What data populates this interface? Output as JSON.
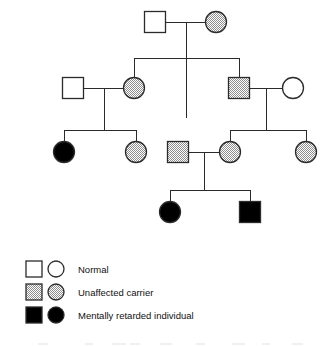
{
  "diagram": {
    "type": "pedigree-chart",
    "title": "",
    "width": 331,
    "height": 346,
    "colors": {
      "line": "#2b2b2b",
      "normal_fill": "#ffffff",
      "carrier_fill": "#9a9a9a",
      "affected_fill": "#000000",
      "background": "#ffffff"
    }
  },
  "legend": {
    "rows": [
      {
        "square_status": "normal",
        "circle_status": "normal",
        "label": "Normal"
      },
      {
        "square_status": "carrier",
        "circle_status": "carrier",
        "label": "Unaffected carrier"
      },
      {
        "square_status": "affected",
        "circle_status": "affected",
        "label": "Mentally retarded individual"
      }
    ]
  },
  "individuals": [
    {
      "id": "I-1",
      "generation": 1,
      "sex": "male",
      "status": "normal",
      "cx": 155,
      "cy": 22,
      "size": 21
    },
    {
      "id": "I-2",
      "generation": 1,
      "sex": "female",
      "status": "carrier",
      "cx": 216,
      "cy": 22,
      "size": 21
    },
    {
      "id": "II-1",
      "generation": 2,
      "sex": "male",
      "status": "normal",
      "cx": 73,
      "cy": 88,
      "size": 21
    },
    {
      "id": "II-2",
      "generation": 2,
      "sex": "female",
      "status": "carrier",
      "cx": 134,
      "cy": 88,
      "size": 21
    },
    {
      "id": "II-3",
      "generation": 2,
      "sex": "male",
      "status": "carrier",
      "cx": 239,
      "cy": 88,
      "size": 21
    },
    {
      "id": "II-4",
      "generation": 2,
      "sex": "female",
      "status": "normal",
      "cx": 293,
      "cy": 88,
      "size": 21
    },
    {
      "id": "III-1",
      "generation": 3,
      "sex": "female",
      "status": "affected",
      "cx": 64,
      "cy": 152,
      "size": 21
    },
    {
      "id": "III-2",
      "generation": 3,
      "sex": "female",
      "status": "carrier",
      "cx": 136,
      "cy": 152,
      "size": 21
    },
    {
      "id": "III-3",
      "generation": 3,
      "sex": "male",
      "status": "carrier",
      "cx": 178,
      "cy": 152,
      "size": 21
    },
    {
      "id": "III-4",
      "generation": 3,
      "sex": "female",
      "status": "carrier",
      "cx": 230,
      "cy": 152,
      "size": 21
    },
    {
      "id": "III-5",
      "generation": 3,
      "sex": "female",
      "status": "carrier",
      "cx": 306,
      "cy": 152,
      "size": 21
    },
    {
      "id": "IV-1",
      "generation": 4,
      "sex": "female",
      "status": "affected",
      "cx": 170,
      "cy": 212,
      "size": 21
    },
    {
      "id": "IV-2",
      "generation": 4,
      "sex": "male",
      "status": "affected",
      "cx": 250,
      "cy": 212,
      "size": 21
    }
  ],
  "matings": [
    {
      "id": "M1",
      "partners": [
        "I-1",
        "I-2"
      ],
      "y": 22,
      "drop_x": 186,
      "drop_to": 118,
      "sibship_y": 58,
      "children": [
        "II-2",
        "II-3"
      ]
    },
    {
      "id": "M2",
      "partners": [
        "II-1",
        "II-2"
      ],
      "y": 88,
      "drop_x": 104,
      "drop_to": 130,
      "sibship_y": 130,
      "children": [
        "III-1",
        "III-2"
      ]
    },
    {
      "id": "M3",
      "partners": [
        "II-3",
        "II-4"
      ],
      "y": 88,
      "drop_x": 266,
      "drop_to": 130,
      "sibship_y": 130,
      "children": [
        "III-4",
        "III-5"
      ]
    },
    {
      "id": "M4",
      "partners": [
        "III-3",
        "III-4"
      ],
      "y": 152,
      "drop_x": 204,
      "drop_to": 190,
      "sibship_y": 190,
      "children": [
        "IV-1",
        "IV-2"
      ]
    }
  ],
  "counts": {
    "generations": 4,
    "individuals": 13,
    "normal": 3,
    "carriers": 7,
    "affected": 3
  }
}
